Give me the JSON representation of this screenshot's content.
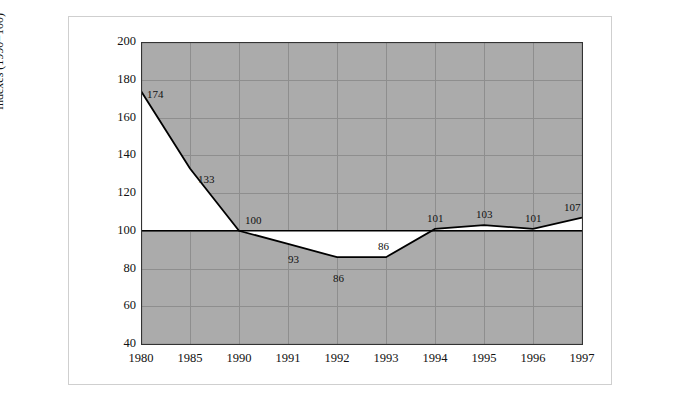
{
  "chart_data": {
    "type": "line",
    "title": "",
    "xlabel": "",
    "ylabel": "Indexes (1990=100)",
    "categories": [
      "1980",
      "1985",
      "1990",
      "1991",
      "1992",
      "1993",
      "1994",
      "1995",
      "1996",
      "1997"
    ],
    "values": [
      174,
      133,
      100,
      93,
      86,
      86,
      101,
      103,
      101,
      107
    ],
    "series": [
      {
        "name": "Indexes (1990=100)",
        "values": [
          174,
          133,
          100,
          93,
          86,
          86,
          101,
          103,
          101,
          107
        ]
      }
    ],
    "point_labels": [
      "174",
      "133",
      "100",
      "93",
      "86",
      "86",
      "101",
      "103",
      "101",
      "107"
    ],
    "ylim": [
      40,
      200
    ],
    "y_ticks": [
      40,
      60,
      80,
      100,
      120,
      140,
      160,
      180,
      200
    ],
    "y_tick_labels": [
      "40",
      "60",
      "80",
      "100",
      "120",
      "140",
      "160",
      "180",
      "200"
    ],
    "reference_line": 100,
    "grid": true,
    "legend": "none",
    "plot_background_color": "#ababab",
    "fill_color": "#ffffff",
    "line_color": "#000000",
    "grid_color": "#8e8e8e",
    "axis_color": "#333333"
  }
}
